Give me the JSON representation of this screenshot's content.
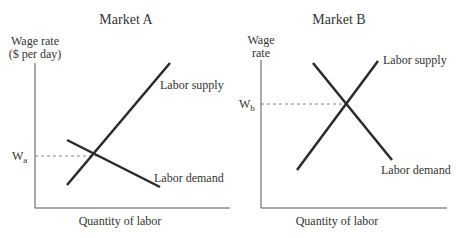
{
  "panels": [
    {
      "title": "Market A",
      "y_label_1": "Wage rate",
      "y_label_2": "($ per day)",
      "x_label": "Quantity of labor",
      "wage_label": "W",
      "wage_sub": "a",
      "supply_label": "Labor supply",
      "demand_label": "Labor demand"
    },
    {
      "title": "Market B",
      "y_label_1": "Wage",
      "y_label_2": "rate",
      "x_label": "Quantity of labor",
      "wage_label": "W",
      "wage_sub": "b",
      "supply_label": "Labor supply",
      "demand_label": "Labor demand"
    }
  ],
  "colors": {
    "line": "#2a2a2a",
    "axis": "#555555",
    "text": "#333333"
  }
}
